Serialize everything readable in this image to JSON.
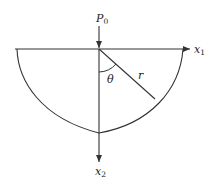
{
  "diagram": {
    "labels": {
      "load": "P",
      "load_sub": "0",
      "x1": "x",
      "x1_sub": "1",
      "x2": "x",
      "x2_sub": "2",
      "radius": "r",
      "angle": "θ"
    },
    "colors": {
      "stroke": "#333333",
      "background": "#ffffff"
    }
  }
}
